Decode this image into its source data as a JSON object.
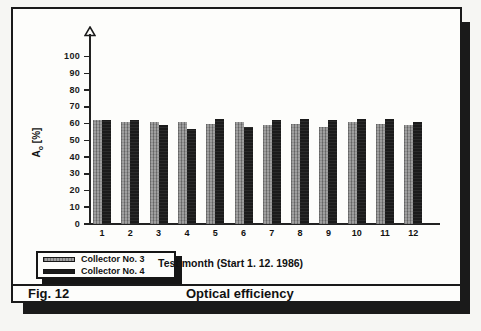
{
  "figure": {
    "fig_label": "Fig. 12",
    "caption": "Optical efficiency"
  },
  "icons": {
    "y_axis_arrow": "hollow-triangle-up"
  },
  "chart_data": {
    "type": "bar",
    "title": "Optical efficiency",
    "xlabel": "Test month (Start 1. 12. 1986)",
    "ylabel": "Ao [%]",
    "ylabel_parts": {
      "base": "A",
      "sub": "o",
      "rest": " [%]"
    },
    "categories": [
      "1",
      "2",
      "3",
      "4",
      "5",
      "6",
      "7",
      "8",
      "9",
      "10",
      "11",
      "12"
    ],
    "series": [
      {
        "name": "Collector No. 3",
        "color": "#949494",
        "values": [
          62,
          61,
          61,
          61,
          60,
          61,
          59,
          60,
          58,
          61,
          60,
          59
        ]
      },
      {
        "name": "Collector No. 4",
        "color": "#1b1b1b",
        "values": [
          62,
          62,
          59,
          57,
          63,
          58,
          62,
          63,
          62,
          63,
          63,
          61
        ]
      }
    ],
    "y_ticks": [
      0,
      10,
      20,
      30,
      40,
      50,
      60,
      70,
      80,
      90,
      100
    ],
    "ylim": [
      0,
      110
    ],
    "grid": false,
    "legend_position": "bottom-left"
  }
}
